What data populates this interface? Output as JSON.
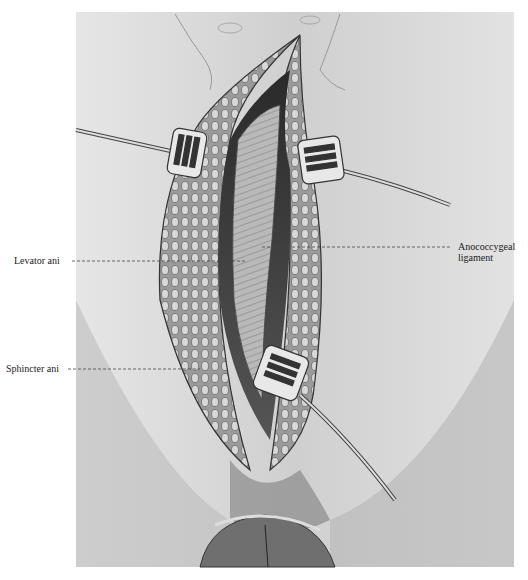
{
  "figure": {
    "labels": {
      "left": [
        {
          "id": "levator",
          "text": "Levator ani"
        },
        {
          "id": "sphincter",
          "text": "Sphincter ani"
        }
      ],
      "right": [
        {
          "id": "anococcygeal",
          "line1": "Anococcygeal",
          "line2": "ligament"
        }
      ]
    }
  }
}
